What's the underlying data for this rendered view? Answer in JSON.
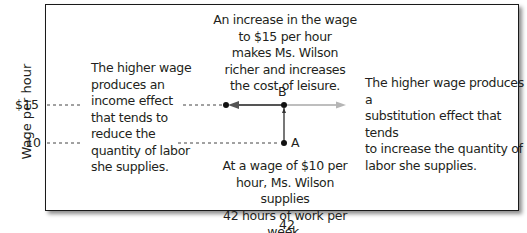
{
  "axes": {
    "ylabel": "Wage per hour",
    "yticks": [
      {
        "label": "$15",
        "value": 15
      },
      {
        "label": "10",
        "value": 10
      }
    ],
    "xticks": [
      {
        "label": "42",
        "value": 42
      }
    ]
  },
  "points": [
    {
      "label": "A",
      "hours": 42,
      "wage": 10
    },
    {
      "label": "B",
      "hours": 42,
      "wage": 15
    }
  ],
  "annotations": {
    "top": [
      "An increase in the wage",
      "to $15 per hour",
      "makes Ms. Wilson",
      "richer and increases",
      "the cost of leisure."
    ],
    "left": [
      "The higher wage",
      "produces an",
      "income effect",
      "that tends to",
      "reduce the",
      "quantity of labor",
      "she supplies."
    ],
    "right": [
      "The higher wage produces a",
      "substitution effect that tends",
      "to increase the quantity of",
      "labor she supplies."
    ],
    "bottom": [
      "At a wage of $10 per",
      "hour, Ms. Wilson supplies",
      "42 hours of work per week."
    ]
  },
  "colors": {
    "income_arrow": "#555555",
    "substitution_arrow": "#a8a8a8",
    "frame": "#1a1a1a",
    "text": "#231f20"
  }
}
